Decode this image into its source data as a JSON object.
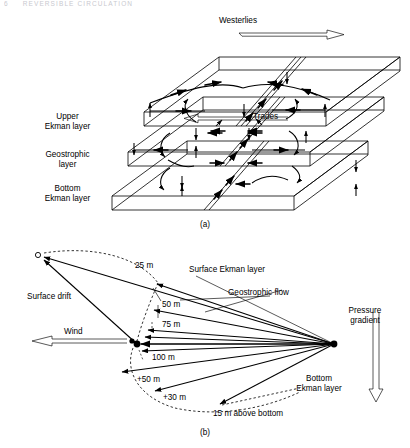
{
  "running_head": {
    "page_number": "6",
    "title": "REVERSIBLE CIRCULATION"
  },
  "figure": {
    "panel_a": {
      "caption": "(a)",
      "wind_labels": [
        {
          "name": "westerlies",
          "text": "Westerlies",
          "direction": "right"
        },
        {
          "name": "trades",
          "text": "Trades",
          "direction": "left"
        }
      ],
      "layer_labels": [
        {
          "name": "upper-ekman-layer",
          "line1": "Upper",
          "line2": "Ekman layer"
        },
        {
          "name": "geostrophic-layer",
          "line1": "Geostrophic",
          "line2": "layer"
        },
        {
          "name": "bottom-ekman-layer",
          "line1": "Bottom",
          "line2": "Ekman layer"
        }
      ]
    },
    "panel_b": {
      "caption": "(b)",
      "origin_marker": "o",
      "labels": [
        {
          "name": "surface-drift",
          "text": "Surface drift"
        },
        {
          "name": "wind",
          "text": "Wind",
          "direction": "left"
        },
        {
          "name": "surface-ekman-layer",
          "text": "Surface Ekman layer"
        },
        {
          "name": "geostrophic-flow",
          "text": "Geostrophic flow"
        },
        {
          "name": "pressure-gradient",
          "line1": "Pressure",
          "line2": "gradient",
          "direction": "down"
        },
        {
          "name": "bottom-ekman-layer",
          "line1": "Bottom",
          "line2": "Ekman layer"
        }
      ],
      "depth_ticks": [
        {
          "name": "depth-25m",
          "text": "25 m"
        },
        {
          "name": "depth-50m",
          "text": "50 m"
        },
        {
          "name": "depth-75m",
          "text": "75 m"
        },
        {
          "name": "depth-100m",
          "text": "100 m"
        },
        {
          "name": "depth-plus-50m",
          "text": "+50 m"
        },
        {
          "name": "depth-plus-30m",
          "text": "+30 m"
        },
        {
          "name": "depth-15m-above-bottom",
          "text": "15 m above bottom"
        }
      ]
    }
  },
  "colors": {
    "ink": "#000000",
    "paper": "#ffffff",
    "faded_head": "#c9c9cf"
  }
}
